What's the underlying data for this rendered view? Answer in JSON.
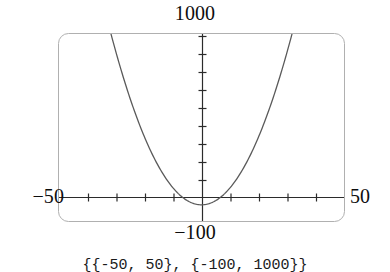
{
  "figure": {
    "kind": "cartesian-plot",
    "frame": {
      "stroke": "#b0b0b0",
      "corner_radius": 10,
      "x_left_px": 58,
      "x_right_px": 345,
      "y_top_px": 33,
      "y_bottom_px": 222
    },
    "axis_color": "#2b2b2b",
    "curve_color": "#5a5a5a"
  },
  "labels": {
    "top": "1000",
    "bottom": "−100",
    "left": "−50",
    "right": "50"
  },
  "caption": {
    "text": "{{-50, 50}, {-100, 1000}}"
  },
  "chart_data": {
    "type": "line",
    "title": "",
    "subtitle": "",
    "xlabel": "",
    "ylabel": "",
    "grid": false,
    "legend": null,
    "legend_position": "none",
    "xlim": [
      -50,
      50
    ],
    "ylim": [
      -100,
      1000
    ],
    "x_axis_label_min": "−50",
    "x_axis_label_max": "50",
    "y_axis_label_min": "−100",
    "y_axis_label_max": "1000",
    "xticks": [
      -40,
      -30,
      -20,
      -10,
      10,
      20,
      30,
      40
    ],
    "yticks": [
      100,
      200,
      300,
      400,
      500,
      600,
      700,
      800,
      900
    ],
    "annotations": [],
    "series": [
      {
        "name": "parabola",
        "expression": "y = x^2",
        "color": "#5a5a5a",
        "x": [
          -31.6,
          -30,
          -28,
          -26,
          -24,
          -22,
          -20,
          -18,
          -16,
          -14,
          -12,
          -10,
          -8,
          -6,
          -4,
          -2,
          0,
          2,
          4,
          6,
          8,
          10,
          12,
          14,
          16,
          18,
          20,
          22,
          24,
          26,
          28,
          30,
          31.6
        ],
        "y": [
          1000,
          900,
          784,
          676,
          576,
          484,
          400,
          324,
          256,
          196,
          144,
          100,
          64,
          36,
          16,
          4,
          0,
          4,
          16,
          36,
          64,
          100,
          144,
          196,
          256,
          324,
          400,
          484,
          576,
          676,
          784,
          900,
          1000
        ]
      }
    ]
  }
}
